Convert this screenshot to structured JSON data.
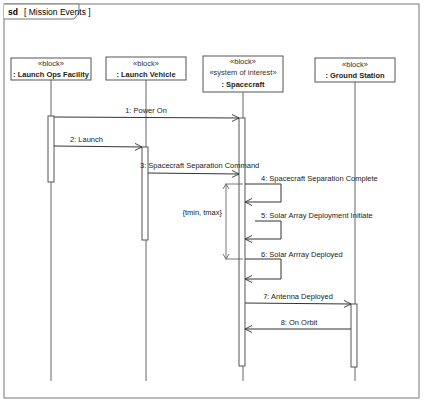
{
  "frame": {
    "kind": "sd",
    "name": "[ Mission Events ]"
  },
  "lifelines": [
    {
      "stereotypes": [
        "«block»"
      ],
      "name": ": Launch Ops Facility"
    },
    {
      "stereotypes": [
        "«block»"
      ],
      "name": ": Launch Vehicle"
    },
    {
      "stereotypes": [
        "«block»",
        "«system of interest»"
      ],
      "name": ": Spacecraft"
    },
    {
      "stereotypes": [
        "«block»"
      ],
      "name": ": Ground Station"
    }
  ],
  "messages": [
    {
      "label": "1: Power On",
      "from": ": Launch Ops Facility",
      "to": ": Spacecraft"
    },
    {
      "label": "2: Launch",
      "from": ": Launch Ops Facility",
      "to": ": Launch Vehicle"
    },
    {
      "label": "3: Spacecraft Separation Command",
      "from": ": Launch Vehicle",
      "to": ": Spacecraft"
    },
    {
      "label": "4: Spacecraft Separation Complete",
      "from": ": Spacecraft",
      "to": ": Spacecraft"
    },
    {
      "label": "5: Solar Array Deployment Initiate",
      "from": ": Spacecraft",
      "to": ": Spacecraft"
    },
    {
      "label": "6: Solar Arrray Deployed",
      "from": ": Spacecraft",
      "to": ": Spacecraft"
    },
    {
      "label": "7: Antenna Deployed",
      "from": ": Spacecraft",
      "to": ": Ground Station"
    },
    {
      "label": "8: On Orbit",
      "from": ": Ground Station",
      "to": ": Spacecraft"
    }
  ],
  "constraint": {
    "label": "{tmin, tmax}"
  }
}
